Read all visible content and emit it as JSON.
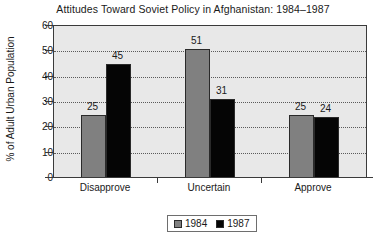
{
  "chart_data": {
    "type": "bar",
    "title": "Attitudes Toward Soviet Policy in Afghanistan: 1984–1987",
    "xlabel": "",
    "ylabel": "% of Adult Urban Population",
    "categories": [
      "Disapprove",
      "Uncertain",
      "Approve"
    ],
    "series": [
      {
        "name": "1984",
        "color": "#808080",
        "values": [
          25,
          51,
          25
        ]
      },
      {
        "name": "1987",
        "color": "#050505",
        "values": [
          45,
          31,
          24
        ]
      }
    ],
    "ylim": [
      0,
      60
    ],
    "yticks": [
      0,
      10,
      20,
      30,
      40,
      50,
      60
    ],
    "ytick_labels": [
      "0",
      "10",
      "20",
      "30",
      "40",
      "50",
      "60"
    ],
    "grid": "horizontal-dotted",
    "legend_position": "bottom-center",
    "data_labels": [
      {
        "series": "1984",
        "category": "Disapprove",
        "value": "25"
      },
      {
        "series": "1987",
        "category": "Disapprove",
        "value": "45"
      },
      {
        "series": "1984",
        "category": "Uncertain",
        "value": "51"
      },
      {
        "series": "1987",
        "category": "Uncertain",
        "value": "31"
      },
      {
        "series": "1984",
        "category": "Approve",
        "value": "25"
      },
      {
        "series": "1987",
        "category": "Approve",
        "value": "24"
      }
    ],
    "plot_background": "#e8e8e8"
  },
  "legend": {
    "entries": [
      {
        "label": "1984"
      },
      {
        "label": "1987"
      }
    ]
  }
}
